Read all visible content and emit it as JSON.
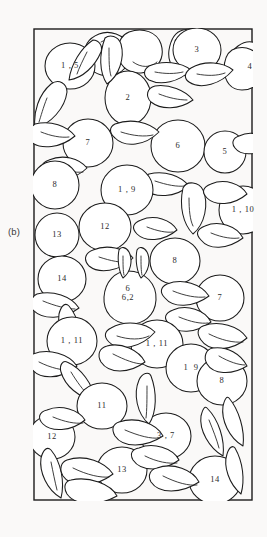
{
  "figure": {
    "panel_caption": "(b)",
    "frame": {
      "x": 33,
      "y": 28,
      "width": 220,
      "height": 473
    },
    "stroke_color": "#1c1c1c",
    "fill_color": "#ffffff",
    "background_color": "#faf9f8",
    "text_color": "#2b2b2b"
  },
  "labels": [
    {
      "id": "label-1-5",
      "text": "1 , 5",
      "x": 37,
      "y": 38,
      "lines": [
        "1 , 5"
      ]
    },
    {
      "id": "label-3",
      "text": "3",
      "x": 164,
      "y": 22,
      "lines": [
        "3"
      ]
    },
    {
      "id": "label-4",
      "text": "4",
      "x": 217,
      "y": 39,
      "lines": [
        "4"
      ]
    },
    {
      "id": "label-2",
      "text": "2",
      "x": 95,
      "y": 70,
      "lines": [
        "2"
      ]
    },
    {
      "id": "label-7-a",
      "text": "7",
      "x": 55,
      "y": 115,
      "lines": [
        "7"
      ]
    },
    {
      "id": "label-6-a",
      "text": "6",
      "x": 145,
      "y": 118,
      "lines": [
        "6"
      ]
    },
    {
      "id": "label-5",
      "text": "5",
      "x": 192,
      "y": 124,
      "lines": [
        "5"
      ]
    },
    {
      "id": "label-8-a",
      "text": "8",
      "x": 22,
      "y": 157,
      "lines": [
        "8"
      ]
    },
    {
      "id": "label-1-9-a",
      "text": "1 , 9",
      "x": 94,
      "y": 162,
      "lines": [
        "1 , 9"
      ]
    },
    {
      "id": "label-1-10",
      "text": "1 , 10",
      "x": 210,
      "y": 182,
      "lines": [
        "1 , 10"
      ]
    },
    {
      "id": "label-13-a",
      "text": "13",
      "x": 24,
      "y": 207,
      "lines": [
        "13"
      ]
    },
    {
      "id": "label-12-a",
      "text": "12",
      "x": 72,
      "y": 199,
      "lines": [
        "12"
      ]
    },
    {
      "id": "label-14-a",
      "text": "14",
      "x": 29,
      "y": 251,
      "lines": [
        "14"
      ]
    },
    {
      "id": "label-6-62",
      "text": "6 / 6,2",
      "x": 95,
      "y": 265,
      "lines": [
        "6",
        "6,2"
      ]
    },
    {
      "id": "label-8-b",
      "text": "8",
      "x": 142,
      "y": 233,
      "lines": [
        "8"
      ]
    },
    {
      "id": "label-7-b",
      "text": "7",
      "x": 187,
      "y": 270,
      "lines": [
        "7"
      ]
    },
    {
      "id": "label-1-11-a",
      "text": "1 , 11",
      "x": 39,
      "y": 313,
      "lines": [
        "1 , 11"
      ]
    },
    {
      "id": "label-1-11-b",
      "text": "1 , 11",
      "x": 124,
      "y": 316,
      "lines": [
        "1 , 11"
      ]
    },
    {
      "id": "label-1-9-b",
      "text": "1  9",
      "x": 158,
      "y": 340,
      "lines": [
        "1  9"
      ]
    },
    {
      "id": "label-11",
      "text": "11",
      "x": 69,
      "y": 378,
      "lines": [
        "11"
      ]
    },
    {
      "id": "label-8-c",
      "text": "8",
      "x": 189,
      "y": 353,
      "lines": [
        "8"
      ]
    },
    {
      "id": "label-12-b",
      "text": "12",
      "x": 19,
      "y": 409,
      "lines": [
        "12"
      ]
    },
    {
      "id": "label-3-7",
      "text": "3 , 7",
      "x": 133,
      "y": 408,
      "lines": [
        "3 , 7"
      ]
    },
    {
      "id": "label-13-b",
      "text": "13",
      "x": 89,
      "y": 442,
      "lines": [
        "13"
      ]
    },
    {
      "id": "label-14-b",
      "text": "14",
      "x": 182,
      "y": 452,
      "lines": [
        "14"
      ]
    }
  ]
}
